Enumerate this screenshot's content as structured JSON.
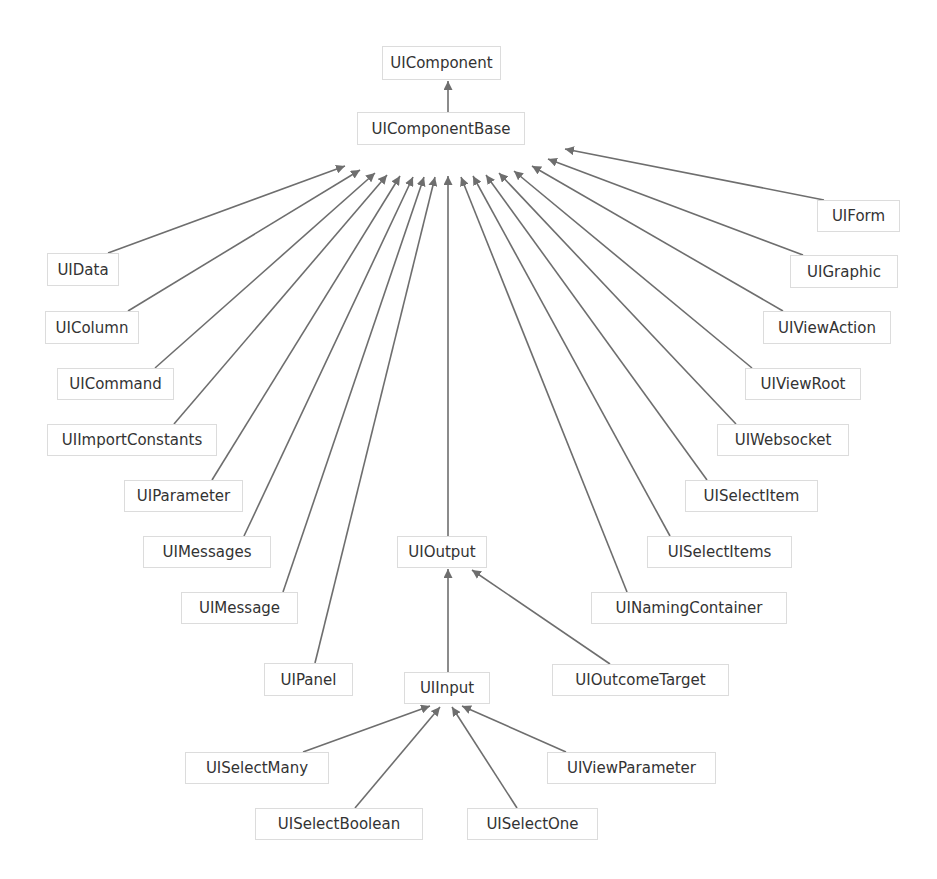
{
  "diagram": {
    "type": "class-hierarchy",
    "colors": {
      "edge": "#6e6e6e",
      "node_border": "#dcdcdc",
      "text": "#333333",
      "background": "#ffffff"
    },
    "nodes": [
      {
        "id": "UIComponent",
        "label": "UIComponent",
        "x": 382,
        "y": 46,
        "w": 119,
        "h": 34
      },
      {
        "id": "UIComponentBase",
        "label": "UIComponentBase",
        "x": 357,
        "y": 112,
        "w": 168,
        "h": 33
      },
      {
        "id": "UIData",
        "label": "UIData",
        "x": 47,
        "y": 253,
        "w": 72,
        "h": 33
      },
      {
        "id": "UIColumn",
        "label": "UIColumn",
        "x": 45,
        "y": 311,
        "w": 94,
        "h": 33
      },
      {
        "id": "UICommand",
        "label": "UICommand",
        "x": 57,
        "y": 368,
        "w": 117,
        "h": 32
      },
      {
        "id": "UIImportConstants",
        "label": "UIImportConstants",
        "x": 47,
        "y": 424,
        "w": 170,
        "h": 32
      },
      {
        "id": "UIParameter",
        "label": "UIParameter",
        "x": 124,
        "y": 480,
        "w": 119,
        "h": 32
      },
      {
        "id": "UIMessages",
        "label": "UIMessages",
        "x": 143,
        "y": 536,
        "w": 128,
        "h": 32
      },
      {
        "id": "UIMessage",
        "label": "UIMessage",
        "x": 181,
        "y": 592,
        "w": 117,
        "h": 32
      },
      {
        "id": "UIPanel",
        "label": "UIPanel",
        "x": 264,
        "y": 663,
        "w": 89,
        "h": 33
      },
      {
        "id": "UIOutput",
        "label": "UIOutput",
        "x": 397,
        "y": 536,
        "w": 90,
        "h": 32
      },
      {
        "id": "UIInput",
        "label": "UIInput",
        "x": 404,
        "y": 672,
        "w": 86,
        "h": 32
      },
      {
        "id": "UISelectMany",
        "label": "UISelectMany",
        "x": 185,
        "y": 752,
        "w": 144,
        "h": 32
      },
      {
        "id": "UISelectBoolean",
        "label": "UISelectBoolean",
        "x": 255,
        "y": 808,
        "w": 168,
        "h": 32
      },
      {
        "id": "UISelectOne",
        "label": "UISelectOne",
        "x": 467,
        "y": 808,
        "w": 131,
        "h": 32
      },
      {
        "id": "UIViewParameter",
        "label": "UIViewParameter",
        "x": 547,
        "y": 752,
        "w": 169,
        "h": 32
      },
      {
        "id": "UIOutcomeTarget",
        "label": "UIOutcomeTarget",
        "x": 552,
        "y": 664,
        "w": 177,
        "h": 32
      },
      {
        "id": "UINamingContainer",
        "label": "UINamingContainer",
        "x": 591,
        "y": 592,
        "w": 196,
        "h": 32
      },
      {
        "id": "UISelectItems",
        "label": "UISelectItems",
        "x": 647,
        "y": 536,
        "w": 145,
        "h": 32
      },
      {
        "id": "UISelectItem",
        "label": "UISelectItem",
        "x": 685,
        "y": 480,
        "w": 133,
        "h": 32
      },
      {
        "id": "UIWebsocket",
        "label": "UIWebsocket",
        "x": 717,
        "y": 424,
        "w": 132,
        "h": 32
      },
      {
        "id": "UIViewRoot",
        "label": "UIViewRoot",
        "x": 745,
        "y": 368,
        "w": 116,
        "h": 32
      },
      {
        "id": "UIViewAction",
        "label": "UIViewAction",
        "x": 763,
        "y": 311,
        "w": 128,
        "h": 33
      },
      {
        "id": "UIGraphic",
        "label": "UIGraphic",
        "x": 790,
        "y": 255,
        "w": 108,
        "h": 33
      },
      {
        "id": "UIForm",
        "label": "UIForm",
        "x": 817,
        "y": 200,
        "w": 83,
        "h": 32
      }
    ],
    "edges": [
      {
        "from": "UIComponentBase",
        "to": "UIComponent",
        "x1": 448,
        "y1": 112,
        "x2": 448,
        "y2": 81
      },
      {
        "from": "UIData",
        "to": "UIComponentBase",
        "x1": 108,
        "y1": 253,
        "x2": 345,
        "y2": 166
      },
      {
        "from": "UIColumn",
        "to": "UIComponentBase",
        "x1": 128,
        "y1": 311,
        "x2": 360,
        "y2": 170
      },
      {
        "from": "UICommand",
        "to": "UIComponentBase",
        "x1": 155,
        "y1": 368,
        "x2": 375,
        "y2": 173
      },
      {
        "from": "UIImportConstants",
        "to": "UIComponentBase",
        "x1": 174,
        "y1": 424,
        "x2": 387,
        "y2": 175
      },
      {
        "from": "UIParameter",
        "to": "UIComponentBase",
        "x1": 212,
        "y1": 480,
        "x2": 400,
        "y2": 176
      },
      {
        "from": "UIMessages",
        "to": "UIComponentBase",
        "x1": 244,
        "y1": 536,
        "x2": 413,
        "y2": 177
      },
      {
        "from": "UIMessage",
        "to": "UIComponentBase",
        "x1": 283,
        "y1": 592,
        "x2": 424,
        "y2": 177
      },
      {
        "from": "UIPanel",
        "to": "UIComponentBase",
        "x1": 315,
        "y1": 663,
        "x2": 435,
        "y2": 177
      },
      {
        "from": "UIOutput",
        "to": "UIComponentBase",
        "x1": 448,
        "y1": 536,
        "x2": 448,
        "y2": 176
      },
      {
        "from": "UINamingContainer",
        "to": "UIComponentBase",
        "x1": 627,
        "y1": 592,
        "x2": 461,
        "y2": 177
      },
      {
        "from": "UISelectItems",
        "to": "UIComponentBase",
        "x1": 670,
        "y1": 536,
        "x2": 473,
        "y2": 176
      },
      {
        "from": "UISelectItem",
        "to": "UIComponentBase",
        "x1": 707,
        "y1": 480,
        "x2": 486,
        "y2": 175
      },
      {
        "from": "UIWebsocket",
        "to": "UIComponentBase",
        "x1": 736,
        "y1": 424,
        "x2": 499,
        "y2": 173
      },
      {
        "from": "UIViewRoot",
        "to": "UIComponentBase",
        "x1": 752,
        "y1": 368,
        "x2": 514,
        "y2": 171
      },
      {
        "from": "UIViewAction",
        "to": "UIComponentBase",
        "x1": 783,
        "y1": 311,
        "x2": 532,
        "y2": 166
      },
      {
        "from": "UIGraphic",
        "to": "UIComponentBase",
        "x1": 803,
        "y1": 255,
        "x2": 548,
        "y2": 159
      },
      {
        "from": "UIForm",
        "to": "UIComponentBase",
        "x1": 824,
        "y1": 200,
        "x2": 565,
        "y2": 149
      },
      {
        "from": "UIInput",
        "to": "UIOutput",
        "x1": 448,
        "y1": 672,
        "x2": 448,
        "y2": 569
      },
      {
        "from": "UIOutcomeTarget",
        "to": "UIOutput",
        "x1": 610,
        "y1": 664,
        "x2": 472,
        "y2": 570
      },
      {
        "from": "UISelectMany",
        "to": "UIInput",
        "x1": 303,
        "y1": 752,
        "x2": 430,
        "y2": 706
      },
      {
        "from": "UISelectBoolean",
        "to": "UIInput",
        "x1": 355,
        "y1": 808,
        "x2": 440,
        "y2": 707
      },
      {
        "from": "UISelectOne",
        "to": "UIInput",
        "x1": 517,
        "y1": 808,
        "x2": 452,
        "y2": 707
      },
      {
        "from": "UIViewParameter",
        "to": "UIInput",
        "x1": 566,
        "y1": 752,
        "x2": 462,
        "y2": 706
      }
    ]
  }
}
